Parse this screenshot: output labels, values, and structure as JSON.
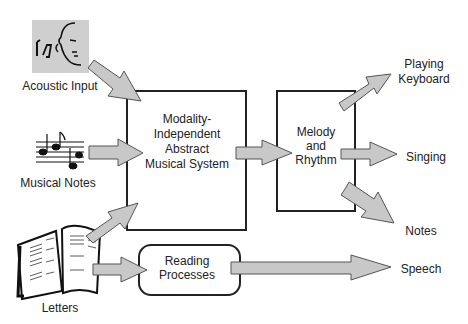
{
  "diagram": {
    "inputs": {
      "acoustic": {
        "label": "Acoustic Input",
        "icon": "ear-face-music-icon"
      },
      "notes": {
        "label": "Musical Notes",
        "icon": "music-staff-icon"
      },
      "letters": {
        "label": "Letters",
        "icon": "open-book-icon"
      }
    },
    "main_box": {
      "lines": [
        "Modality-",
        "Independent",
        "Abstract",
        "Musical System"
      ]
    },
    "melody_box": {
      "lines": [
        "Melody",
        "and",
        "Rhythm"
      ]
    },
    "reading_box": {
      "lines": [
        "Reading",
        "Processes"
      ]
    },
    "outputs": {
      "keyboard": {
        "lines": [
          "Playing",
          "Keyboard"
        ]
      },
      "singing": {
        "label": "Singing"
      },
      "notes": {
        "label": "Notes"
      },
      "speech": {
        "label": "Speech"
      }
    },
    "colors": {
      "arrow_fill": "#c8c8c8",
      "arrow_stroke": "#555555",
      "box_stroke": "#222222",
      "icon_bg": "#cfcfcf"
    }
  }
}
